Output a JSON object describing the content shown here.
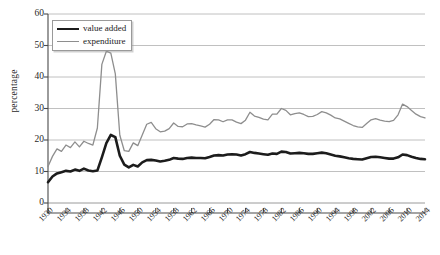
{
  "chart_data": {
    "type": "line",
    "title": "",
    "xlabel": "",
    "ylabel": "percentage",
    "ylim": [
      0,
      60
    ],
    "yticks": [
      0,
      10,
      20,
      30,
      40,
      50,
      60
    ],
    "xlim": [
      1930,
      2014
    ],
    "xticks": [
      1930,
      1934,
      1938,
      1942,
      1946,
      1950,
      1954,
      1958,
      1962,
      1966,
      1970,
      1974,
      1978,
      1982,
      1986,
      1990,
      1994,
      1998,
      2002,
      2006,
      2010,
      2014
    ],
    "grid": "horizontal",
    "legend_position": "top-left",
    "x": [
      1930,
      1931,
      1932,
      1933,
      1934,
      1935,
      1936,
      1937,
      1938,
      1939,
      1940,
      1941,
      1942,
      1943,
      1944,
      1945,
      1946,
      1947,
      1948,
      1949,
      1950,
      1951,
      1952,
      1953,
      1954,
      1955,
      1956,
      1957,
      1958,
      1959,
      1960,
      1961,
      1962,
      1963,
      1964,
      1965,
      1966,
      1967,
      1968,
      1969,
      1970,
      1971,
      1972,
      1973,
      1974,
      1975,
      1976,
      1977,
      1978,
      1979,
      1980,
      1981,
      1982,
      1983,
      1984,
      1985,
      1986,
      1987,
      1988,
      1989,
      1990,
      1991,
      1992,
      1993,
      1994,
      1995,
      1996,
      1997,
      1998,
      1999,
      2000,
      2001,
      2002,
      2003,
      2004,
      2005,
      2006,
      2007,
      2008,
      2009,
      2010,
      2011,
      2012,
      2013,
      2014
    ],
    "series": [
      {
        "name": "value added",
        "color": "#1c1c1c",
        "line_width": 2.6,
        "values": [
          6.6,
          8.4,
          9.4,
          9.8,
          10.2,
          10.0,
          10.6,
          10.2,
          10.9,
          10.3,
          10.1,
          10.3,
          14.5,
          19.0,
          21.6,
          20.9,
          15.0,
          12.2,
          11.3,
          12.1,
          11.6,
          12.9,
          13.6,
          13.7,
          13.5,
          13.2,
          13.4,
          13.7,
          14.3,
          14.1,
          14.0,
          14.3,
          14.4,
          14.3,
          14.3,
          14.2,
          14.6,
          15.1,
          15.2,
          15.1,
          15.4,
          15.5,
          15.4,
          15.1,
          15.5,
          16.2,
          15.9,
          15.7,
          15.5,
          15.3,
          15.7,
          15.6,
          16.3,
          16.2,
          15.7,
          15.8,
          15.9,
          15.8,
          15.6,
          15.6,
          15.8,
          16.0,
          15.8,
          15.4,
          15.0,
          14.8,
          14.5,
          14.2,
          14.0,
          13.9,
          13.8,
          14.2,
          14.6,
          14.7,
          14.5,
          14.3,
          14.1,
          14.1,
          14.5,
          15.4,
          15.2,
          14.7,
          14.3,
          14.0,
          13.9
        ]
      },
      {
        "name": "expenditure",
        "color": "#8e8e8e",
        "line_width": 1.3,
        "values": [
          11.6,
          14.8,
          17.2,
          16.4,
          18.4,
          17.6,
          19.4,
          17.8,
          19.6,
          18.9,
          18.4,
          23.8,
          44.0,
          48.2,
          47.6,
          41.0,
          21.5,
          16.6,
          16.4,
          19.1,
          18.2,
          21.6,
          25.0,
          25.6,
          23.6,
          22.6,
          22.8,
          23.6,
          25.4,
          24.3,
          24.2,
          25.1,
          25.2,
          24.8,
          24.5,
          24.1,
          25.0,
          26.5,
          26.4,
          25.8,
          26.4,
          26.4,
          25.7,
          25.2,
          26.3,
          28.8,
          27.6,
          27.2,
          26.6,
          26.4,
          28.2,
          28.2,
          30.0,
          29.4,
          28.0,
          28.4,
          28.6,
          28.1,
          27.4,
          27.5,
          28.1,
          29.0,
          28.6,
          27.9,
          27.0,
          26.7,
          26.0,
          25.3,
          24.6,
          24.2,
          24.0,
          25.2,
          26.4,
          26.8,
          26.3,
          26.0,
          25.8,
          26.2,
          28.0,
          31.4,
          30.6,
          29.4,
          28.2,
          27.4,
          27.0
        ]
      }
    ]
  }
}
